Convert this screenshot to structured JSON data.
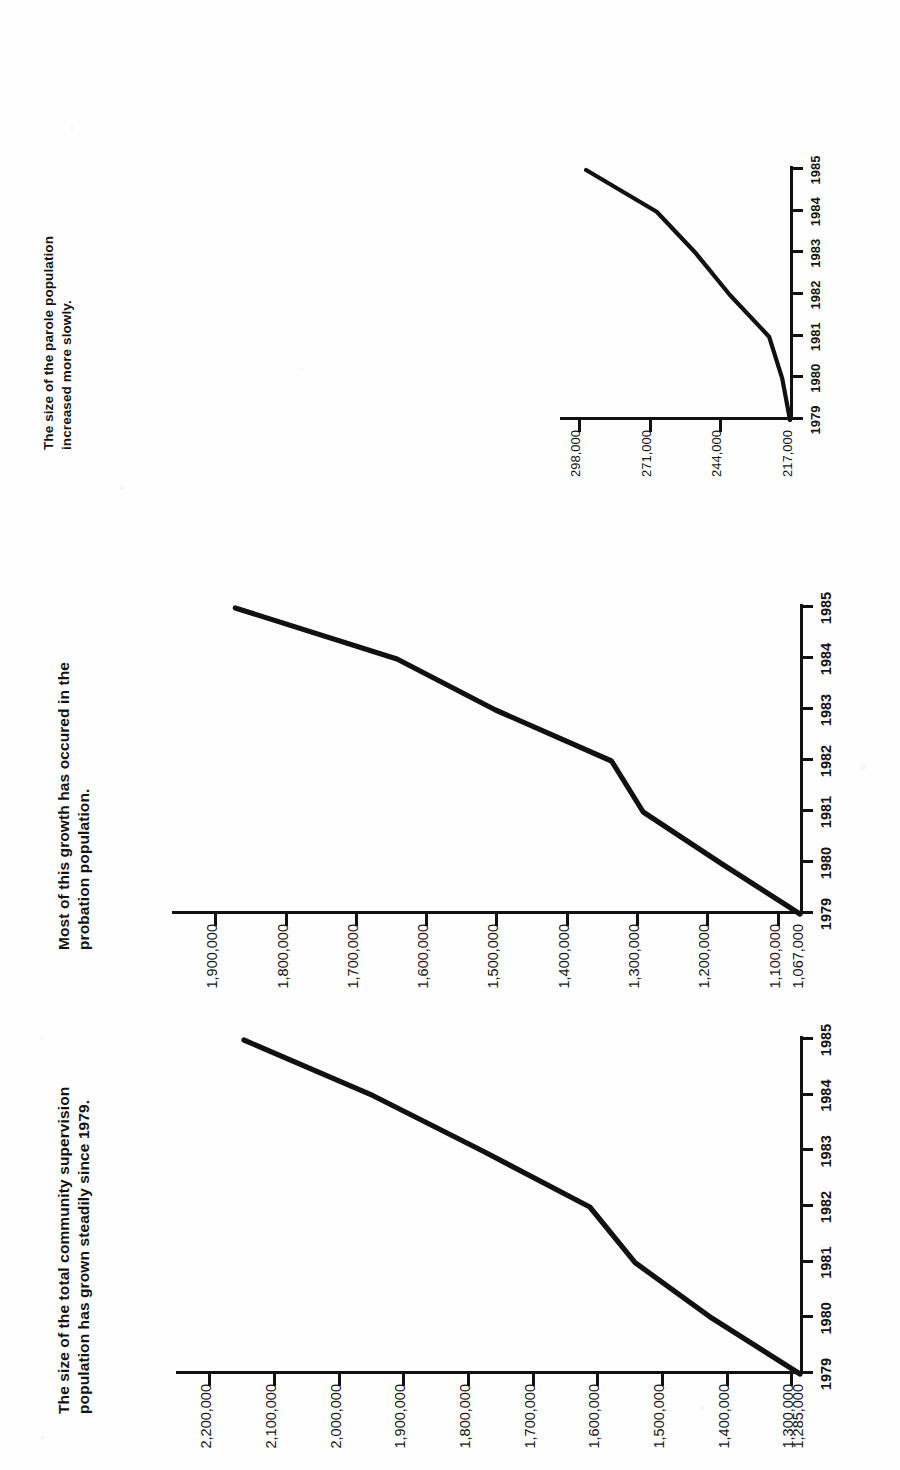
{
  "page": {
    "background": "#fefefe",
    "ink": "#111111",
    "orientation": "rotated-90-ccw",
    "figure_count": 3
  },
  "chart_data": [
    {
      "id": "total-community-supervision",
      "type": "line",
      "title": "The size of the total community supervision\npopulation has grown steadily since 1979.",
      "xlabel": "",
      "ylabel": "",
      "x": [
        "1979",
        "1980",
        "1981",
        "1982",
        "1983",
        "1984",
        "1985"
      ],
      "xticklabels": [
        "1979",
        "1980",
        "1981",
        "1982",
        "1983",
        "1984",
        "1985"
      ],
      "yticklabels": [
        "1,285,000",
        "1,300,000",
        "1,400,000",
        "1,500,000",
        "1,600,000",
        "1,700,000",
        "1,800,000",
        "1,900,000",
        "2,000,000",
        "2,100,000",
        "2,200,000"
      ],
      "ytickvalues": [
        1285000,
        1300000,
        1400000,
        1500000,
        1600000,
        1700000,
        1800000,
        1900000,
        2000000,
        2100000,
        2200000
      ],
      "ylim": [
        1285000,
        2250000
      ],
      "values": [
        1285000,
        1421000,
        1540000,
        1610000,
        1775000,
        1945000,
        2145000
      ],
      "baseline_label": "1,285,000",
      "grid": false,
      "legend": "none",
      "series": [
        {
          "name": "Total community supervision population",
          "values": [
            1285000,
            1421000,
            1540000,
            1610000,
            1775000,
            1945000,
            2145000
          ]
        }
      ]
    },
    {
      "id": "probation-population",
      "type": "line",
      "title": "Most of this growth has occured in the\nprobation population.",
      "xlabel": "",
      "ylabel": "",
      "x": [
        "1979",
        "1980",
        "1981",
        "1982",
        "1983",
        "1984",
        "1985"
      ],
      "xticklabels": [
        "1979",
        "1980",
        "1981",
        "1982",
        "1983",
        "1984",
        "1985"
      ],
      "yticklabels": [
        "1,067,000",
        "1,100,000",
        "1,200,000",
        "1,300,000",
        "1,400,000",
        "1,500,000",
        "1,600,000",
        "1,700,000",
        "1,800,000",
        "1,900,000"
      ],
      "ytickvalues": [
        1067000,
        1100000,
        1200000,
        1300000,
        1400000,
        1500000,
        1600000,
        1700000,
        1800000,
        1900000
      ],
      "ylim": [
        1067000,
        1960000
      ],
      "values": [
        1067000,
        1180000,
        1290000,
        1335000,
        1500000,
        1640000,
        1870000
      ],
      "baseline_label": "1,067,000",
      "grid": false,
      "legend": "none",
      "series": [
        {
          "name": "Probation population",
          "values": [
            1067000,
            1180000,
            1290000,
            1335000,
            1500000,
            1640000,
            1870000
          ]
        }
      ]
    },
    {
      "id": "parole-population",
      "type": "line",
      "title": "The size of the parole population\nincreased more slowly.",
      "xlabel": "",
      "ylabel": "",
      "x": [
        "1979",
        "1980",
        "1981",
        "1982",
        "1983",
        "1984",
        "1985"
      ],
      "xticklabels": [
        "1979",
        "1980",
        "1981",
        "1982",
        "1983",
        "1984",
        "1985"
      ],
      "yticklabels": [
        "217,000",
        "244,000",
        "271,000",
        "298,000"
      ],
      "ytickvalues": [
        217000,
        244000,
        271000,
        298000
      ],
      "ylim": [
        217000,
        305000
      ],
      "values": [
        217000,
        220000,
        225000,
        240000,
        253000,
        268000,
        295000
      ],
      "baseline_label": "217,000",
      "grid": false,
      "legend": "none",
      "series": [
        {
          "name": "Parole population",
          "values": [
            217000,
            220000,
            225000,
            240000,
            253000,
            268000,
            295000
          ]
        }
      ]
    }
  ]
}
